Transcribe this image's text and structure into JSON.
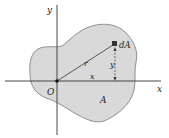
{
  "diagram": {
    "labels": {
      "y_axis": "y",
      "x_axis": "x",
      "origin": "O",
      "radius": "r",
      "x_dist": "x",
      "y_dist": "y",
      "element": "dA",
      "area": "A"
    },
    "colors": {
      "region_fill": "#d9d9d9",
      "region_stroke": "#777777",
      "axis": "#333333",
      "element": "#333333"
    }
  }
}
